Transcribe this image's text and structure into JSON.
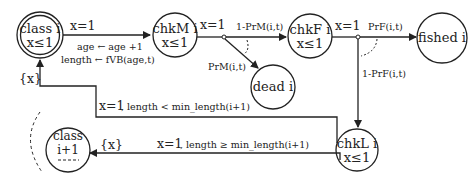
{
  "diagram": {
    "type": "state-transition",
    "nodes": {
      "class_i": {
        "line1": "class i",
        "line2": "x≤1"
      },
      "chkM": {
        "line1": "chkM i",
        "line2": "x≤1"
      },
      "chkF": {
        "line1": "chkF i",
        "line2": "x≤1"
      },
      "fished": {
        "label": "fished i"
      },
      "dead": {
        "label": "dead i"
      },
      "chkL": {
        "line1": "chkL i",
        "line2": "x≤1"
      },
      "class_next": {
        "line1": "class",
        "line2": "i+1",
        "line3": "----"
      }
    },
    "edges": {
      "class_to_chkM": {
        "guard": "x=1",
        "update1": "age ← age +1",
        "update2": "length ← fVB(age,t)"
      },
      "chkM_guard": "x=1",
      "chkM_survive": "1-PrM(i,t)",
      "chkM_die": "PrM(i,t)",
      "chkF_guard": "x=1",
      "chkF_fished": "PrF(i,t)",
      "chkF_notfished": "1-PrF(i,t)",
      "back_reset": "{x}",
      "back_guard": "x=1",
      "back_cond": ", length < min_length(i+1)",
      "next_reset": "{x}",
      "next_guard": "x=1",
      "next_cond": ", length ≥ min_length(i+1)"
    }
  }
}
